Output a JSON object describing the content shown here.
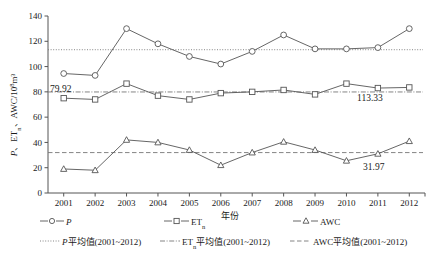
{
  "chart_data": {
    "type": "line",
    "title": "",
    "xlabel": "年份",
    "ylabel": "P、ETn、AWC/10⁸m³",
    "ylabel_parts": {
      "p": "P",
      "sep1": "、",
      "et": "ET",
      "et_sub": "n",
      "sep2": "、",
      "awc": "AWC/10",
      "exp": "8",
      "unit": "m³"
    },
    "categories": [
      "2001",
      "2002",
      "2003",
      "2004",
      "2005",
      "2006",
      "2007",
      "2008",
      "2009",
      "2010",
      "2011",
      "2012"
    ],
    "x": [
      2001,
      2002,
      2003,
      2004,
      2005,
      2006,
      2007,
      2008,
      2009,
      2010,
      2011,
      2012
    ],
    "xlim": [
      2000.5,
      2012.5
    ],
    "ylim": [
      0,
      140
    ],
    "yticks": [
      0,
      20,
      40,
      60,
      80,
      100,
      120,
      140
    ],
    "grid": false,
    "legend_position": "below-axis",
    "series": [
      {
        "name": "P",
        "marker": "circle",
        "values": [
          94.5,
          93.0,
          130.0,
          118.0,
          108.0,
          102.0,
          112.0,
          125.0,
          114.0,
          114.0,
          115.0,
          130.0
        ]
      },
      {
        "name": "ETn",
        "marker": "square",
        "values": [
          75.0,
          74.0,
          86.5,
          77.0,
          74.0,
          79.0,
          80.0,
          81.5,
          78.0,
          86.5,
          83.0,
          83.5
        ]
      },
      {
        "name": "AWC",
        "marker": "triangle",
        "values": [
          19.0,
          18.0,
          42.0,
          40.0,
          34.0,
          22.0,
          32.0,
          40.5,
          34.0,
          25.5,
          31.0,
          41.0
        ]
      }
    ],
    "mean_lines": [
      {
        "name": "P_mean",
        "value": 113.33,
        "label": "113.33",
        "style": "dotted"
      },
      {
        "name": "ETn_mean",
        "value": 79.92,
        "label": "79.92",
        "style": "dash-dot"
      },
      {
        "name": "AWC_mean",
        "value": 31.97,
        "label": "31.97",
        "style": "dashed"
      }
    ],
    "annotations": [
      {
        "text": "113.33",
        "series": "P"
      },
      {
        "text": "79.92",
        "series": "ETn"
      },
      {
        "text": "31.97",
        "series": "AWC"
      }
    ]
  },
  "legend": {
    "row1": [
      {
        "label": "P",
        "marker": "circle",
        "style": "solid"
      },
      {
        "label": "ET",
        "sub": "n",
        "marker": "square",
        "style": "solid"
      },
      {
        "label": "AWC",
        "marker": "triangle",
        "style": "solid"
      }
    ],
    "row2": [
      {
        "label": "P平均值(2001~2012)",
        "prefix": "P",
        "rest": "平均值(2001~2012)",
        "style": "dotted"
      },
      {
        "label": "ETn平均值(2001~2012)",
        "prefix": "ET",
        "sub": "n",
        "rest": "平均值(2001~2012)",
        "style": "dash-dot"
      },
      {
        "label": "AWC平均值(2001~2012)",
        "prefix": "AWC",
        "rest": "平均值(2001~2012)",
        "style": "dashed"
      }
    ]
  },
  "colors": {
    "line": "#555555",
    "mean_line": "#777777",
    "text": "#1a1a1a",
    "background": "#ffffff"
  }
}
